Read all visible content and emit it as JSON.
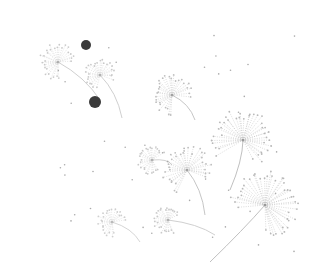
{
  "image": {
    "description": "Scattered dandelion seed heads drawn in fine gray stippled lines on a white background, with two dark seeds",
    "background": "#ffffff",
    "stroke_color": "#8a8a8a",
    "dark_seed_color": "#3a3a3a"
  },
  "seeds": [
    {
      "cx": 58,
      "cy": 62,
      "r": 18,
      "stem_to": [
        100,
        100
      ],
      "opacity": 0.45
    },
    {
      "cx": 100,
      "cy": 75,
      "r": 15,
      "stem_to": [
        122,
        118
      ],
      "opacity": 0.45
    },
    {
      "cx": 172,
      "cy": 95,
      "r": 20,
      "stem_to": [
        195,
        120
      ],
      "opacity": 0.55
    },
    {
      "cx": 243,
      "cy": 140,
      "r": 30,
      "stem_to": [
        230,
        190
      ],
      "opacity": 0.6
    },
    {
      "cx": 152,
      "cy": 160,
      "r": 14,
      "stem_to": [
        172,
        165
      ],
      "opacity": 0.45
    },
    {
      "cx": 187,
      "cy": 170,
      "r": 24,
      "stem_to": [
        205,
        215
      ],
      "opacity": 0.55
    },
    {
      "cx": 265,
      "cy": 205,
      "r": 34,
      "stem_to": [
        210,
        262
      ],
      "opacity": 0.6
    },
    {
      "cx": 112,
      "cy": 222,
      "r": 14,
      "stem_to": [
        140,
        242
      ],
      "opacity": 0.4
    },
    {
      "cx": 168,
      "cy": 220,
      "r": 14,
      "stem_to": [
        215,
        235
      ],
      "opacity": 0.45
    }
  ],
  "dark_dots": [
    {
      "cx": 86,
      "cy": 45,
      "r": 5
    },
    {
      "cx": 95,
      "cy": 102,
      "r": 6
    }
  ]
}
